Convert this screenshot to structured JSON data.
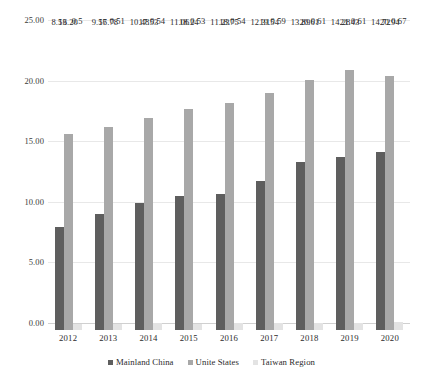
{
  "chart_data": {
    "type": "bar",
    "title": "",
    "subtitle": "",
    "xlabel": "",
    "ylabel": "",
    "ylim": [
      0,
      25
    ],
    "ytick_values": [
      0,
      5,
      10,
      15,
      20,
      25
    ],
    "ytick_labels": [
      "0.00",
      "5.00",
      "10.00",
      "15.00",
      "20.00",
      "25.00"
    ],
    "grid": true,
    "legend_position": "bottom",
    "categories": [
      "2012",
      "2013",
      "2014",
      "2015",
      "2016",
      "2017",
      "2018",
      "2019",
      "2020"
    ],
    "series": [
      {
        "name": "Mainland China",
        "color": "#5e5e5e",
        "values": [
          8.53,
          9.57,
          10.48,
          11.06,
          11.23,
          12.31,
          13.89,
          14.28,
          14.72
        ],
        "labels": [
          "8.53",
          "9.57",
          "10.48",
          "11.06",
          "11.23",
          "12.31",
          "13.89",
          "14.28",
          "14.72"
        ]
      },
      {
        "name": "Unite States",
        "color": "#a8a8a8",
        "values": [
          16.2,
          16.78,
          17.53,
          18.24,
          18.75,
          19.54,
          20.61,
          21.43,
          20.94
        ],
        "labels": [
          "16.20",
          "16.78",
          "17.53",
          "18.24",
          "18.75",
          "19.54",
          "20.61",
          "21.43",
          "20.94"
        ]
      },
      {
        "name": "Taiwan Region",
        "color": "#e3e3e3",
        "values": [
          0.5,
          0.51,
          0.54,
          0.53,
          0.54,
          0.59,
          0.61,
          0.61,
          0.67
        ],
        "labels": [
          "0.5",
          "0.51",
          "0.54",
          "0.53",
          "0.54",
          "0.59",
          "0.61",
          "0.61",
          "0.67"
        ]
      }
    ]
  }
}
